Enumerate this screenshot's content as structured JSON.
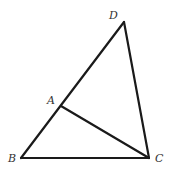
{
  "diagram": {
    "type": "geometry",
    "points": {
      "D": {
        "label": "D",
        "x": 124,
        "y": 22,
        "label_x": 109,
        "label_y": 19
      },
      "A": {
        "label": "A",
        "x": 61,
        "y": 106,
        "label_x": 47,
        "label_y": 104
      },
      "B": {
        "label": "B",
        "x": 21,
        "y": 158,
        "label_x": 8,
        "label_y": 162
      },
      "C": {
        "label": "C",
        "x": 149,
        "y": 158,
        "label_x": 155,
        "label_y": 162
      }
    },
    "segments": [
      {
        "name": "segment-BD",
        "from": "B",
        "to": "D"
      },
      {
        "name": "segment-DC",
        "from": "D",
        "to": "C"
      },
      {
        "name": "segment-BC",
        "from": "B",
        "to": "C"
      },
      {
        "name": "segment-AC",
        "from": "A",
        "to": "C"
      }
    ],
    "stroke_color": "#1a1a1a",
    "label_color": "#333333"
  }
}
